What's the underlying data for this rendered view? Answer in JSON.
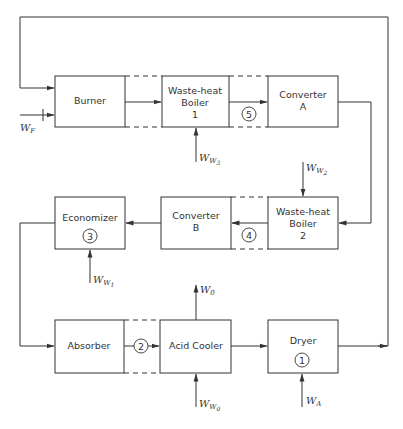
{
  "diagram": {
    "type": "process-flow",
    "units": [
      {
        "id": "burner",
        "label_lines": [
          "Burner"
        ]
      },
      {
        "id": "waste_heat_boiler_1",
        "label_lines": [
          "Waste-heat",
          "Boiler",
          "1"
        ]
      },
      {
        "id": "converter_a",
        "label_lines": [
          "Converter",
          "A"
        ]
      },
      {
        "id": "waste_heat_boiler_2",
        "label_lines": [
          "Waste-heat",
          "Boiler",
          "2"
        ]
      },
      {
        "id": "converter_b",
        "label_lines": [
          "Converter",
          "B"
        ]
      },
      {
        "id": "economizer",
        "label_lines": [
          "Economizer"
        ],
        "circle": "3"
      },
      {
        "id": "absorber",
        "label_lines": [
          "Absorber"
        ]
      },
      {
        "id": "acid_cooler",
        "label_lines": [
          "Acid Cooler"
        ]
      },
      {
        "id": "dryer",
        "label_lines": [
          "Dryer"
        ],
        "circle": "1"
      }
    ],
    "stream_markers": {
      "m1": "1",
      "m2": "2",
      "m3": "3",
      "m4": "4",
      "m5": "5"
    },
    "inputs": {
      "wf": {
        "main": "W",
        "sub": "F"
      },
      "ww3": {
        "main": "W",
        "sub": "W",
        "subsub": "3"
      },
      "ww2": {
        "main": "W",
        "sub": "W",
        "subsub": "2"
      },
      "ww1": {
        "main": "W",
        "sub": "W",
        "subsub": "1"
      },
      "w0": {
        "main": "W",
        "sub": "0"
      },
      "ww0": {
        "main": "W",
        "sub": "W",
        "subsub": "0"
      },
      "wa": {
        "main": "W",
        "sub": "A"
      }
    },
    "flows": [
      [
        "burner",
        "waste_heat_boiler_1"
      ],
      [
        "waste_heat_boiler_1",
        "converter_a"
      ],
      [
        "converter_a",
        "waste_heat_boiler_2"
      ],
      [
        "waste_heat_boiler_2",
        "converter_b"
      ],
      [
        "converter_b",
        "economizer"
      ],
      [
        "economizer",
        "absorber"
      ],
      [
        "absorber",
        "acid_cooler"
      ],
      [
        "acid_cooler",
        "dryer"
      ],
      [
        "dryer",
        "burner"
      ]
    ]
  }
}
